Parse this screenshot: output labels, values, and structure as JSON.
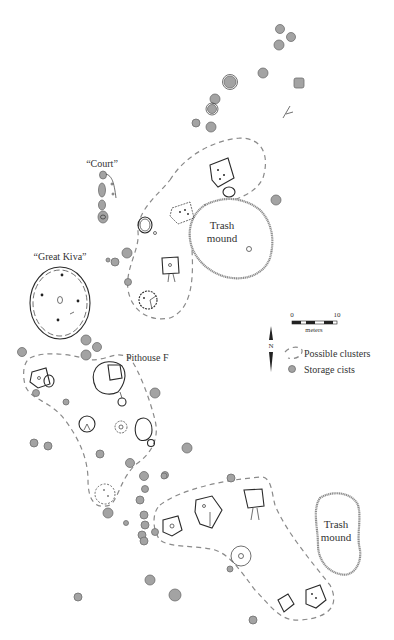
{
  "figure": {
    "type": "archaeological site plan",
    "colors": {
      "storage_cist_fill": "#a3a3a3",
      "cluster_outline": "#8a8a8a",
      "feature_ink": "#2a2a2a",
      "trash_mound_outline": "#8c8c8c",
      "background": "#ffffff"
    }
  },
  "labels": {
    "court": "“Court”",
    "great_kiva": "“Great Kiva”",
    "pithouse_f": "Pithouse F",
    "trash_mound_upper_line1": "Trash",
    "trash_mound_upper_line2": "mound",
    "trash_mound_lower_line1": "Trash",
    "trash_mound_lower_line2": "mound"
  },
  "scale_bar": {
    "start_label": "0",
    "end_label": "10",
    "unit_label": "meters"
  },
  "north_arrow": {
    "label": "N"
  },
  "legend": {
    "items": [
      {
        "symbol": "dashed-outline",
        "label": "Possible clusters"
      },
      {
        "symbol": "gray-filled-circle",
        "label": "Storage cists"
      }
    ]
  }
}
